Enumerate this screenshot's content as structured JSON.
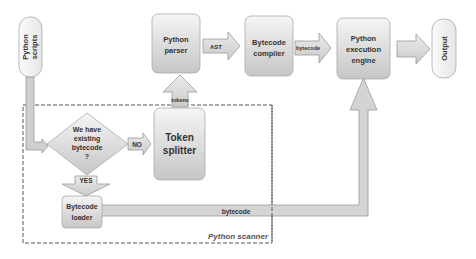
{
  "diagram": {
    "type": "flowchart",
    "nodes": {
      "scripts": {
        "label_lines": [
          "Python",
          "scripts"
        ],
        "shape": "pill-vertical"
      },
      "decision": {
        "label_lines": [
          "We have",
          "existing",
          "bytecode",
          "?"
        ],
        "shape": "diamond"
      },
      "token_splitter": {
        "label_lines": [
          "Token",
          "splitter"
        ],
        "shape": "rounded-rect"
      },
      "parser": {
        "label_lines": [
          "Python",
          "parser"
        ],
        "shape": "rounded-rect"
      },
      "compiler": {
        "label_lines": [
          "Bytecode",
          "compiler"
        ],
        "shape": "rounded-rect"
      },
      "engine": {
        "label_lines": [
          "Python",
          "execution",
          "engine"
        ],
        "shape": "rounded-rect"
      },
      "output": {
        "label": "Output",
        "shape": "pill-vertical"
      },
      "loader": {
        "label_lines": [
          "Bytecode",
          "loader"
        ],
        "shape": "rounded-rect"
      }
    },
    "edges": {
      "no": {
        "from": "decision",
        "to": "token_splitter",
        "label": "NO"
      },
      "yes": {
        "from": "decision",
        "to": "loader",
        "label": "YES"
      },
      "tokens": {
        "from": "token_splitter",
        "to": "parser",
        "label": "tokens"
      },
      "ast": {
        "from": "parser",
        "to": "compiler",
        "label": "AST"
      },
      "bytecode_compiled": {
        "from": "compiler",
        "to": "engine",
        "label": "bytecode"
      },
      "bytecode_loaded": {
        "from": "loader",
        "to": "engine",
        "label": "bytecode"
      },
      "output": {
        "from": "engine",
        "to": "output",
        "label": ""
      },
      "scripts_in": {
        "from": "scripts",
        "to": "decision",
        "label": ""
      }
    },
    "group": {
      "label": "Python scanner",
      "contains": [
        "decision",
        "token_splitter",
        "loader"
      ]
    },
    "colors": {
      "box_fill_top": "#f4f4f4",
      "box_fill_bottom": "#c8c8c8",
      "arrow_fill": "#d9d9d9",
      "stroke": "#9a9a9a",
      "text": "#333333",
      "dash": "#555555"
    }
  }
}
